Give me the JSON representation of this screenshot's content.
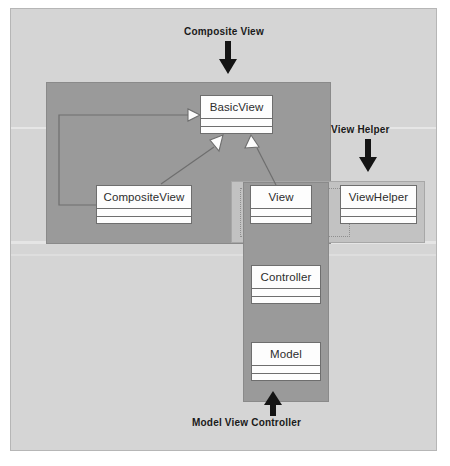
{
  "diagram": {
    "type": "uml-class-diagram",
    "background_color": "#d5d5d5",
    "group_fill_dark": "#9a9a9a",
    "group_fill_light": "#c2c2c2",
    "class_fill": "#fdfdfd",
    "line_color": "#6e6e6e",
    "annotation_color": "#1a1a1a"
  },
  "annotations": [
    {
      "id": "composite-view",
      "label": "Composite View",
      "points_to": "composite-view-group",
      "arrow_direction": "down"
    },
    {
      "id": "view-helper",
      "label": "View Helper",
      "points_to": "view-helper-group",
      "arrow_direction": "down"
    },
    {
      "id": "model-view-controller",
      "label": "Model View Controller",
      "points_to": "mvc-group",
      "arrow_direction": "up"
    }
  ],
  "groups": [
    {
      "id": "composite-view-group",
      "label": "Composite View",
      "fill": "#9a9a9a",
      "contains": [
        "BasicView",
        "CompositeView",
        "View"
      ]
    },
    {
      "id": "view-helper-group",
      "label": "View Helper",
      "fill": "#c2c2c2",
      "contains": [
        "View",
        "ViewHelper"
      ]
    },
    {
      "id": "mvc-group",
      "label": "Model View Controller",
      "fill": "#9a9a9a",
      "contains": [
        "View",
        "Controller",
        "Model"
      ]
    }
  ],
  "classes": [
    {
      "id": "basicview",
      "name": "BasicView",
      "compartments": 2
    },
    {
      "id": "compositeview",
      "name": "CompositeView",
      "compartments": 2
    },
    {
      "id": "view",
      "name": "View",
      "compartments": 2
    },
    {
      "id": "viewhelper",
      "name": "ViewHelper",
      "compartments": 2
    },
    {
      "id": "controller",
      "name": "Controller",
      "compartments": 2
    },
    {
      "id": "model",
      "name": "Model",
      "compartments": 2
    }
  ],
  "relationships": [
    {
      "id": "compositeview-aggregates-basicview",
      "from": "CompositeView",
      "to": "BasicView",
      "type": "aggregation",
      "source_marker": "open-diamond",
      "target_marker": "open-arrow"
    },
    {
      "id": "compositeview-inherits-basicview",
      "from": "CompositeView",
      "to": "BasicView",
      "type": "generalization",
      "target_marker": "hollow-triangle"
    },
    {
      "id": "view-inherits-basicview",
      "from": "View",
      "to": "BasicView",
      "type": "generalization",
      "target_marker": "hollow-triangle"
    }
  ]
}
